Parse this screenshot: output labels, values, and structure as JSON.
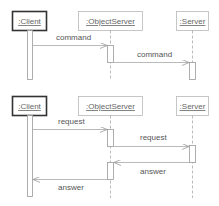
{
  "colors": {
    "active_object_border": "#333333",
    "object_border": "#b8b8b8",
    "line": "#a8a8a8",
    "activation_border": "#999999",
    "text": "#555555"
  },
  "diagrams": [
    {
      "objects": [
        {
          "name": ":Client",
          "active": true
        },
        {
          "name": ":ObjectServer",
          "active": false
        },
        {
          "name": ":Server",
          "active": false
        }
      ],
      "messages": [
        {
          "label": "command",
          "from": ":Client",
          "to": ":ObjectServer"
        },
        {
          "label": "command",
          "from": ":ObjectServer",
          "to": ":Server"
        }
      ]
    },
    {
      "objects": [
        {
          "name": ":Client",
          "active": true
        },
        {
          "name": ":ObjectServer",
          "active": false
        },
        {
          "name": ":Server",
          "active": false
        }
      ],
      "messages": [
        {
          "label": "request",
          "from": ":Client",
          "to": ":ObjectServer"
        },
        {
          "label": "request",
          "from": ":ObjectServer",
          "to": ":Server"
        },
        {
          "label": "answer",
          "from": ":Server",
          "to": ":ObjectServer"
        },
        {
          "label": "answer",
          "from": ":ObjectServer",
          "to": ":Client"
        }
      ]
    }
  ]
}
